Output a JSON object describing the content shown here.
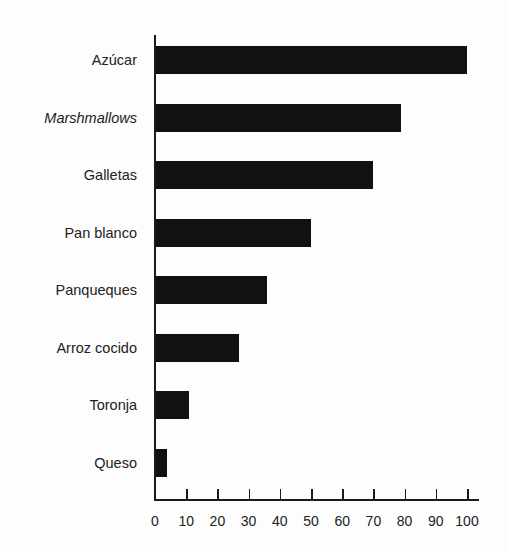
{
  "chart_data": {
    "type": "bar",
    "orientation": "horizontal",
    "title": "",
    "xlabel": "",
    "ylabel": "",
    "categories": [
      "Azúcar",
      "Marshmallows",
      "Galletas",
      "Pan blanco",
      "Panqueques",
      "Arroz cocido",
      "Toronja",
      "Queso"
    ],
    "values": [
      100,
      79,
      70,
      50,
      36,
      27,
      11,
      4
    ],
    "italic_categories": [
      "Marshmallows"
    ],
    "xlim": [
      0,
      100
    ],
    "xticks": [
      "0",
      "10",
      "20",
      "30",
      "40",
      "50",
      "60",
      "70",
      "80",
      "90",
      "100"
    ],
    "grid": false,
    "legend": null,
    "bar_color": "#111111"
  }
}
